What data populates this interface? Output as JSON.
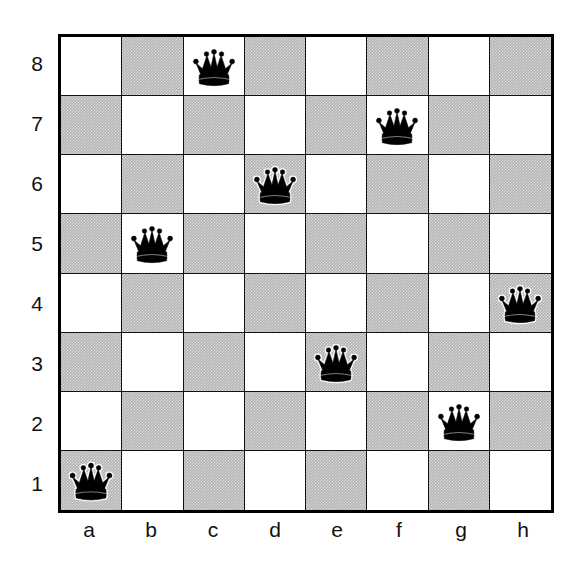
{
  "figure": {
    "kind": "chess-diagram"
  },
  "board": {
    "files": [
      "a",
      "b",
      "c",
      "d",
      "e",
      "f",
      "g",
      "h"
    ],
    "ranks": [
      "8",
      "7",
      "6",
      "5",
      "4",
      "3",
      "2",
      "1"
    ],
    "light_color": "#ffffff",
    "dark_color": "#b4b4b4",
    "border_color": "#000000",
    "piece_color": "#000000",
    "piece_outline_color": "#ffffff",
    "squares_per_side": 8
  },
  "chart_data": {
    "type": "table",
    "xlabel": "file",
    "ylabel": "rank",
    "categories": [
      "a",
      "b",
      "c",
      "d",
      "e",
      "f",
      "g",
      "h"
    ],
    "x": [
      "a",
      "b",
      "c",
      "d",
      "e",
      "f",
      "g",
      "h"
    ],
    "values": [
      1,
      5,
      8,
      6,
      3,
      7,
      2,
      4
    ],
    "series": [
      {
        "name": "queen rank by file",
        "values": [
          1,
          5,
          8,
          6,
          3,
          7,
          2,
          4
        ]
      }
    ],
    "ylim": [
      1,
      8
    ],
    "grid": true,
    "legend": "none",
    "annotations": [
      "a1",
      "b5",
      "c8",
      "d6",
      "e3",
      "f7",
      "g2",
      "h4"
    ]
  },
  "pieces": [
    {
      "square": "c8",
      "file": "c",
      "rank": "8",
      "type": "queen",
      "color": "black",
      "icon": "queen-icon"
    },
    {
      "square": "f7",
      "file": "f",
      "rank": "7",
      "type": "queen",
      "color": "black",
      "icon": "queen-icon"
    },
    {
      "square": "d6",
      "file": "d",
      "rank": "6",
      "type": "queen",
      "color": "black",
      "icon": "queen-icon"
    },
    {
      "square": "b5",
      "file": "b",
      "rank": "5",
      "type": "queen",
      "color": "black",
      "icon": "queen-icon"
    },
    {
      "square": "h4",
      "file": "h",
      "rank": "4",
      "type": "queen",
      "color": "black",
      "icon": "queen-icon"
    },
    {
      "square": "e3",
      "file": "e",
      "rank": "3",
      "type": "queen",
      "color": "black",
      "icon": "queen-icon"
    },
    {
      "square": "g2",
      "file": "g",
      "rank": "2",
      "type": "queen",
      "color": "black",
      "icon": "queen-icon"
    },
    {
      "square": "a1",
      "file": "a",
      "rank": "1",
      "type": "queen",
      "color": "black",
      "icon": "queen-icon"
    }
  ]
}
